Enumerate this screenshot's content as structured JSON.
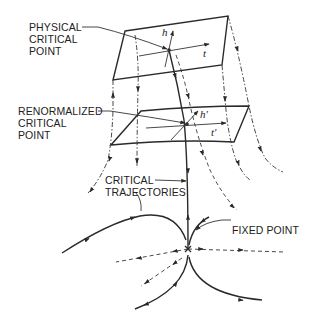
{
  "figure": {
    "labels": {
      "physical": [
        "PHYSICAL",
        "CRITICAL",
        "POINT"
      ],
      "renormalized": [
        "RENORMALIZED",
        "CRITICAL",
        "POINT"
      ],
      "trajectories": [
        "CRITICAL",
        "TRAJECTORIES"
      ],
      "fixed_point": "FIXED POINT"
    },
    "axes": {
      "top_h": "h",
      "top_t": "t",
      "mid_h": "h'",
      "mid_t": "t'"
    },
    "colors": {
      "ink": "#2a2a2a",
      "background": "#ffffff"
    }
  }
}
